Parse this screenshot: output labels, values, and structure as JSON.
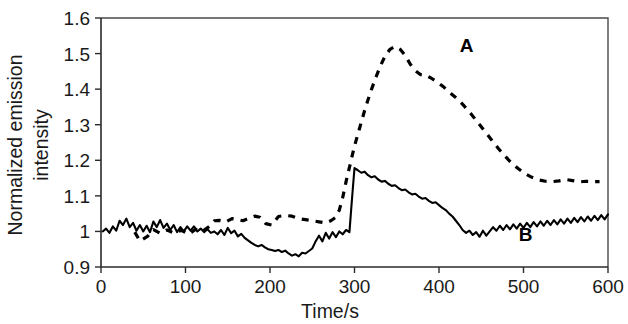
{
  "figure": {
    "background_color": "#ffffff",
    "ink_color": "#000000"
  },
  "chart_data": {
    "type": "line",
    "title": "",
    "subtitle": "",
    "xlabel": "Time/s",
    "ylabel": "Normalized emission intensity",
    "ylabel_line1": "Normalized emission",
    "ylabel_line2": "intensity",
    "xlim": [
      0,
      600
    ],
    "ylim": [
      0.9,
      1.6
    ],
    "xticks": [
      0,
      100,
      200,
      300,
      400,
      500,
      600
    ],
    "xtick_labels": [
      "0",
      "100",
      "200",
      "300",
      "400",
      "500",
      "600"
    ],
    "yticks": [
      0.9,
      1.0,
      1.1,
      1.2,
      1.3,
      1.4,
      1.5,
      1.6
    ],
    "ytick_labels": [
      "0.9",
      "1",
      "1.1",
      "1.2",
      "1.3",
      "1.4",
      "1.5",
      "1.6"
    ],
    "grid": false,
    "legend": "inline-annotations",
    "annotations": [
      {
        "text": "A",
        "x": 390,
        "y": 1.52
      },
      {
        "text": "B",
        "x": 460,
        "y": 0.99
      }
    ],
    "series": [
      {
        "name": "A",
        "style": "dashed",
        "color": "#000000",
        "label_text": "A",
        "points": [
          [
            40,
            0.998
          ],
          [
            46,
            0.973
          ],
          [
            55,
            0.986
          ],
          [
            62,
            1.005
          ],
          [
            70,
            0.995
          ],
          [
            78,
            1.004
          ],
          [
            86,
            0.996
          ],
          [
            95,
            1.003
          ],
          [
            104,
            0.992
          ],
          [
            112,
            1.006
          ],
          [
            120,
            1.0
          ],
          [
            128,
            1.014
          ],
          [
            134,
            1.03
          ],
          [
            140,
            1.031
          ],
          [
            148,
            1.027
          ],
          [
            155,
            1.036
          ],
          [
            162,
            1.033
          ],
          [
            168,
            1.03
          ],
          [
            175,
            1.037
          ],
          [
            182,
            1.043
          ],
          [
            188,
            1.04
          ],
          [
            195,
            1.022
          ],
          [
            202,
            1.018
          ],
          [
            210,
            1.042
          ],
          [
            218,
            1.045
          ],
          [
            226,
            1.043
          ],
          [
            234,
            1.036
          ],
          [
            242,
            1.033
          ],
          [
            250,
            1.03
          ],
          [
            258,
            1.027
          ],
          [
            266,
            1.024
          ],
          [
            272,
            1.03
          ],
          [
            278,
            1.04
          ],
          [
            282,
            1.06
          ],
          [
            286,
            1.095
          ],
          [
            290,
            1.14
          ],
          [
            295,
            1.19
          ],
          [
            300,
            1.24
          ],
          [
            306,
            1.29
          ],
          [
            312,
            1.34
          ],
          [
            318,
            1.385
          ],
          [
            324,
            1.425
          ],
          [
            330,
            1.462
          ],
          [
            336,
            1.492
          ],
          [
            342,
            1.512
          ],
          [
            348,
            1.52
          ],
          [
            354,
            1.512
          ],
          [
            360,
            1.495
          ],
          [
            366,
            1.47
          ],
          [
            372,
            1.452
          ],
          [
            378,
            1.441
          ],
          [
            384,
            1.44
          ],
          [
            390,
            1.432
          ],
          [
            398,
            1.42
          ],
          [
            406,
            1.405
          ],
          [
            414,
            1.388
          ],
          [
            422,
            1.372
          ],
          [
            430,
            1.352
          ],
          [
            438,
            1.33
          ],
          [
            446,
            1.306
          ],
          [
            454,
            1.282
          ],
          [
            462,
            1.258
          ],
          [
            470,
            1.234
          ],
          [
            478,
            1.212
          ],
          [
            486,
            1.192
          ],
          [
            494,
            1.176
          ],
          [
            502,
            1.162
          ],
          [
            510,
            1.152
          ],
          [
            518,
            1.145
          ],
          [
            526,
            1.141
          ],
          [
            534,
            1.14
          ],
          [
            542,
            1.142
          ],
          [
            550,
            1.146
          ],
          [
            558,
            1.143
          ],
          [
            566,
            1.139
          ],
          [
            574,
            1.141
          ],
          [
            582,
            1.14
          ],
          [
            590,
            1.14
          ]
        ]
      },
      {
        "name": "B",
        "style": "solid",
        "color": "#000000",
        "label_text": "B",
        "points": [
          [
            2,
            1.0
          ],
          [
            6,
            1.008
          ],
          [
            10,
            0.996
          ],
          [
            14,
            1.014
          ],
          [
            18,
            1.002
          ],
          [
            22,
            1.03
          ],
          [
            26,
            1.018
          ],
          [
            30,
            1.036
          ],
          [
            34,
            1.012
          ],
          [
            38,
            1.024
          ],
          [
            42,
            1.002
          ],
          [
            46,
            1.018
          ],
          [
            50,
            1.0
          ],
          [
            54,
            1.016
          ],
          [
            58,
            0.998
          ],
          [
            62,
            1.028
          ],
          [
            66,
            1.012
          ],
          [
            70,
            1.032
          ],
          [
            74,
            1.01
          ],
          [
            78,
            1.022
          ],
          [
            82,
            1.004
          ],
          [
            86,
            1.018
          ],
          [
            90,
            0.998
          ],
          [
            94,
            1.012
          ],
          [
            98,
            1.0
          ],
          [
            102,
            1.014
          ],
          [
            106,
            1.002
          ],
          [
            110,
            1.014
          ],
          [
            114,
            1.0
          ],
          [
            118,
            1.008
          ],
          [
            122,
            0.998
          ],
          [
            126,
            1.006
          ],
          [
            130,
            0.996
          ],
          [
            134,
            1.0
          ],
          [
            138,
            0.992
          ],
          [
            142,
            1.004
          ],
          [
            146,
            0.99
          ],
          [
            150,
            1.01
          ],
          [
            154,
            0.995
          ],
          [
            158,
            1.002
          ],
          [
            162,
            0.986
          ],
          [
            166,
            0.993
          ],
          [
            170,
            0.982
          ],
          [
            174,
            0.975
          ],
          [
            178,
            0.968
          ],
          [
            182,
            0.962
          ],
          [
            186,
            0.958
          ],
          [
            190,
            0.962
          ],
          [
            194,
            0.955
          ],
          [
            198,
            0.95
          ],
          [
            202,
            0.948
          ],
          [
            206,
            0.945
          ],
          [
            210,
            0.948
          ],
          [
            214,
            0.942
          ],
          [
            218,
            0.946
          ],
          [
            222,
            0.938
          ],
          [
            226,
            0.932
          ],
          [
            230,
            0.936
          ],
          [
            234,
            0.93
          ],
          [
            238,
            0.94
          ],
          [
            242,
            0.938
          ],
          [
            246,
            0.945
          ],
          [
            250,
            0.952
          ],
          [
            254,
            0.972
          ],
          [
            258,
            0.988
          ],
          [
            262,
            0.972
          ],
          [
            266,
            0.996
          ],
          [
            270,
            0.98
          ],
          [
            274,
            0.998
          ],
          [
            278,
            0.984
          ],
          [
            282,
            1.0
          ],
          [
            286,
            0.992
          ],
          [
            290,
            1.004
          ],
          [
            294,
            0.998
          ],
          [
            296,
            1.06
          ],
          [
            298,
            1.12
          ],
          [
            300,
            1.178
          ],
          [
            304,
            1.172
          ],
          [
            308,
            1.165
          ],
          [
            312,
            1.168
          ],
          [
            316,
            1.158
          ],
          [
            320,
            1.152
          ],
          [
            324,
            1.155
          ],
          [
            328,
            1.146
          ],
          [
            332,
            1.14
          ],
          [
            336,
            1.142
          ],
          [
            340,
            1.134
          ],
          [
            344,
            1.128
          ],
          [
            348,
            1.13
          ],
          [
            352,
            1.122
          ],
          [
            356,
            1.116
          ],
          [
            360,
            1.118
          ],
          [
            364,
            1.11
          ],
          [
            368,
            1.104
          ],
          [
            372,
            1.106
          ],
          [
            376,
            1.098
          ],
          [
            380,
            1.092
          ],
          [
            384,
            1.094
          ],
          [
            388,
            1.086
          ],
          [
            392,
            1.08
          ],
          [
            396,
            1.082
          ],
          [
            400,
            1.074
          ],
          [
            404,
            1.066
          ],
          [
            408,
            1.06
          ],
          [
            412,
            1.05
          ],
          [
            416,
            1.042
          ],
          [
            420,
            1.03
          ],
          [
            424,
            1.018
          ],
          [
            428,
            1.004
          ],
          [
            432,
            0.996
          ],
          [
            436,
            1.002
          ],
          [
            440,
            0.99
          ],
          [
            444,
            0.998
          ],
          [
            448,
            0.985
          ],
          [
            452,
            1.002
          ],
          [
            456,
            0.988
          ],
          [
            460,
            1.0
          ],
          [
            464,
            1.012
          ],
          [
            468,
            1.002
          ],
          [
            472,
            1.016
          ],
          [
            476,
            1.004
          ],
          [
            480,
            1.018
          ],
          [
            484,
            1.006
          ],
          [
            488,
            1.02
          ],
          [
            492,
            1.008
          ],
          [
            496,
            1.022
          ],
          [
            500,
            1.01
          ],
          [
            504,
            1.024
          ],
          [
            508,
            1.012
          ],
          [
            512,
            1.026
          ],
          [
            516,
            1.014
          ],
          [
            520,
            1.028
          ],
          [
            524,
            1.016
          ],
          [
            528,
            1.03
          ],
          [
            532,
            1.018
          ],
          [
            536,
            1.032
          ],
          [
            540,
            1.02
          ],
          [
            544,
            1.034
          ],
          [
            548,
            1.022
          ],
          [
            552,
            1.036
          ],
          [
            556,
            1.024
          ],
          [
            560,
            1.038
          ],
          [
            564,
            1.026
          ],
          [
            568,
            1.04
          ],
          [
            572,
            1.028
          ],
          [
            576,
            1.042
          ],
          [
            580,
            1.03
          ],
          [
            584,
            1.044
          ],
          [
            588,
            1.032
          ],
          [
            592,
            1.046
          ],
          [
            596,
            1.034
          ],
          [
            600,
            1.048
          ],
          [
            604,
            1.036
          ],
          [
            608,
            1.05
          ],
          [
            612,
            1.038
          ],
          [
            616,
            1.052
          ],
          [
            620,
            1.04
          ],
          [
            624,
            1.054
          ],
          [
            628,
            1.042
          ],
          [
            632,
            1.056
          ],
          [
            636,
            1.044
          ],
          [
            640,
            1.058
          ],
          [
            644,
            1.046
          ],
          [
            648,
            1.062
          ],
          [
            652,
            1.048
          ],
          [
            656,
            1.064
          ],
          [
            660,
            1.05
          ],
          [
            664,
            1.066
          ],
          [
            668,
            1.052
          ],
          [
            672,
            1.068
          ],
          [
            676,
            1.054
          ],
          [
            680,
            1.07
          ],
          [
            684,
            1.056
          ],
          [
            688,
            1.072
          ],
          [
            692,
            1.058
          ],
          [
            696,
            1.074
          ],
          [
            700,
            1.06
          ]
        ]
      }
    ]
  }
}
